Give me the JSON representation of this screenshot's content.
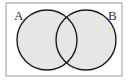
{
  "diagram": {
    "type": "venn",
    "universe": {
      "x": 6,
      "y": 3,
      "width": 116,
      "height": 73,
      "stroke": "#9a9a9a",
      "fill": "#ffffff"
    },
    "sets": [
      {
        "label": "A",
        "cx": 47,
        "cy": 40,
        "r": 30,
        "fill": "#e6e6e6",
        "stroke": "#1a1a1a",
        "label_x": 14,
        "label_y": 20
      },
      {
        "label": "B",
        "cx": 86,
        "cy": 40,
        "r": 30,
        "fill": "#e6e6e6",
        "stroke": "#1a1a1a",
        "label_x": 108,
        "label_y": 20
      }
    ],
    "shaded_region": "A ∪ B"
  }
}
